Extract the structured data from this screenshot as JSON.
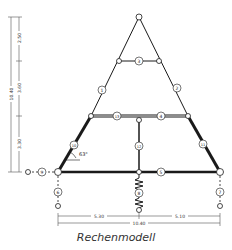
{
  "caption": "Rechenmodell",
  "colors": {
    "line": "#1a1a1a",
    "dim": "#555555",
    "background": "#ffffff"
  },
  "dimensions": {
    "vertical_total": "10.40",
    "vertical_segments": [
      "2.50",
      "3.60",
      "3.30"
    ],
    "horizontal_left": "5.30",
    "horizontal_right": "5.10",
    "horizontal_total": "10.40"
  },
  "angle": "63°",
  "members": {
    "m1": "1",
    "m2": "2",
    "m3": "3",
    "m4": "4",
    "m5": "5",
    "m6": "6",
    "m7": "7",
    "m8": "8",
    "m9": "9",
    "m10": "10",
    "m11": "11",
    "m12": "12",
    "m13": "13",
    "m14": "14"
  }
}
